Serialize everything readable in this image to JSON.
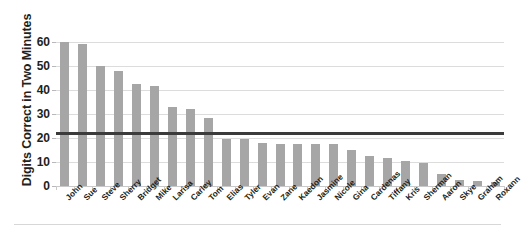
{
  "chart_data": {
    "type": "bar",
    "title": "",
    "subtitle": "",
    "xlabel": "",
    "ylabel": "Digits Correct in Two Minutes",
    "ylim": [
      0,
      65
    ],
    "yticks": [
      0,
      10,
      20,
      30,
      40,
      50,
      60
    ],
    "ytick_labels": [
      "0",
      "10",
      "20",
      "30",
      "40",
      "50",
      "60"
    ],
    "grid": true,
    "grid_axis": "y",
    "legend": false,
    "legend_position": "none",
    "bar_color": "#a6a6a6",
    "gridline_color": "#dcdcdc",
    "reference_line": {
      "label": "",
      "value": 22,
      "color": "#3b3b3b",
      "orientation": "horizontal"
    },
    "categories": [
      "John",
      "Sue",
      "Steve",
      "Sherry",
      "Bridget",
      "Mike",
      "Larisa",
      "Carley",
      "Tom",
      "Elias",
      "Tyler",
      "Evan",
      "Zane",
      "Kaedon",
      "Jasmine",
      "Nicole",
      "Gina",
      "Cardenas",
      "Tiffany",
      "Kris",
      "Sherman",
      "Aaron",
      "Skye",
      "Graham",
      "Roxann"
    ],
    "values": [
      60,
      59,
      50,
      48,
      42.5,
      41.5,
      33,
      32,
      28.5,
      19.5,
      19.5,
      18,
      17.5,
      17.5,
      17.5,
      17.5,
      15,
      12.5,
      11.5,
      10.5,
      9.5,
      5,
      2.5,
      2,
      1.5
    ]
  }
}
